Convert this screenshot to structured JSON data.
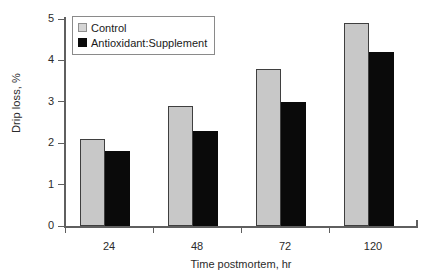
{
  "chart_data": {
    "type": "bar",
    "title": "",
    "categories": [
      "24",
      "48",
      "72",
      "120"
    ],
    "series": [
      {
        "name": "Control",
        "color": "#c8c8c8",
        "values": [
          2.1,
          2.9,
          3.8,
          4.9
        ]
      },
      {
        "name": "Antioxidant:Supplement",
        "color": "#0a0a0a",
        "values": [
          1.8,
          2.3,
          3.0,
          4.2
        ]
      }
    ],
    "xlabel": "Time postmortem, hr",
    "ylabel": "Drip loss, %",
    "ylim": [
      0,
      5
    ],
    "yticks": [
      "0",
      "1",
      "2",
      "3",
      "4",
      "5"
    ],
    "grid": false,
    "legend_position": "top-left"
  }
}
